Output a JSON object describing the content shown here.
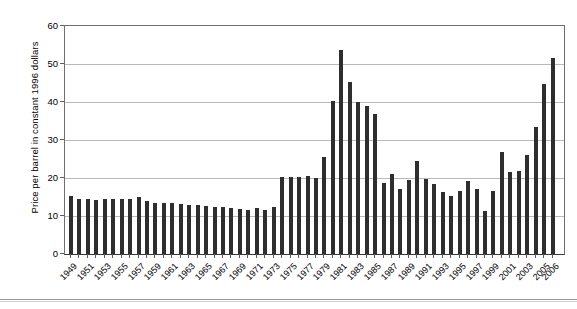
{
  "chart_data": {
    "type": "bar",
    "title": "",
    "subtitle": "",
    "xlabel": "",
    "ylabel": "Price per barrel in constant 1996 dollars",
    "ylim": [
      0,
      60
    ],
    "yticks": [
      0,
      10,
      20,
      30,
      40,
      50,
      60
    ],
    "ytick_labels": [
      "0",
      "10",
      "20",
      "30",
      "40",
      "50",
      "60"
    ],
    "grid": true,
    "legend": null,
    "legend_position": "none",
    "bar_color": "#2e2e2e",
    "categories": [
      "1949",
      "1950",
      "1951",
      "1952",
      "1953",
      "1954",
      "1955",
      "1956",
      "1957",
      "1958",
      "1959",
      "1960",
      "1961",
      "1962",
      "1963",
      "1964",
      "1965",
      "1966",
      "1967",
      "1968",
      "1969",
      "1970",
      "1971",
      "1972",
      "1973",
      "1974",
      "1975",
      "1976",
      "1977",
      "1978",
      "1979",
      "1980",
      "1981",
      "1982",
      "1983",
      "1984",
      "1985",
      "1986",
      "1987",
      "1988",
      "1989",
      "1990",
      "1991",
      "1992",
      "1993",
      "1994",
      "1995",
      "1996",
      "1997",
      "1998",
      "1999",
      "2000",
      "2001",
      "2002",
      "2003",
      "2004",
      "2005",
      "2006"
    ],
    "values": [
      15.3,
      14.6,
      14.4,
      14.2,
      14.5,
      14.6,
      14.5,
      14.4,
      15.0,
      14.0,
      13.5,
      13.4,
      13.4,
      13.2,
      13.0,
      12.8,
      12.6,
      12.4,
      12.4,
      12.0,
      11.9,
      11.5,
      12.2,
      11.7,
      12.4,
      20.3,
      20.2,
      20.3,
      20.4,
      20.0,
      25.5,
      40.2,
      53.7,
      45.2,
      40.1,
      38.9,
      36.8,
      18.8,
      21.0,
      17.0,
      19.5,
      24.5,
      19.8,
      18.4,
      16.3,
      15.3,
      16.6,
      19.3,
      17.0,
      11.3,
      16.6,
      26.8,
      21.6,
      21.8,
      26.1,
      33.5,
      44.8,
      51.5
    ],
    "x_label_years": [
      "1949",
      "1951",
      "1953",
      "1955",
      "1957",
      "1959",
      "1961",
      "1963",
      "1965",
      "1967",
      "1969",
      "1971",
      "1973",
      "1975",
      "1977",
      "1979",
      "1981",
      "1983",
      "1985",
      "1987",
      "1989",
      "1991",
      "1993",
      "1995",
      "1997",
      "1999",
      "2001",
      "2003",
      "2005",
      "2006"
    ]
  }
}
